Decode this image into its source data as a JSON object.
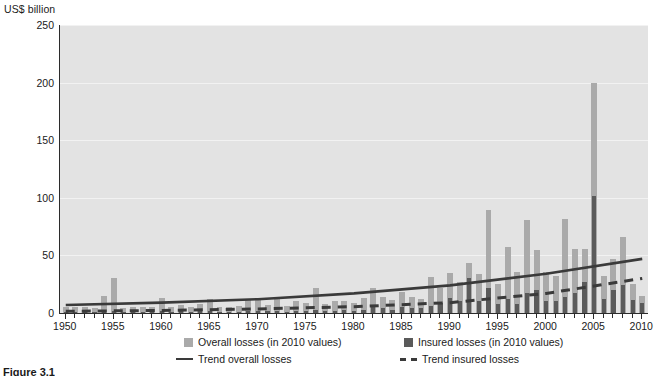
{
  "axis_title": "US$ billion",
  "caption": "Figure 3.1",
  "legend": {
    "overall_bar": "Overall losses (in 2010 values)",
    "insured_bar": "Insured losses (in 2010 values)",
    "trend_overall": "Trend overall losses",
    "trend_insured": "Trend insured losses"
  },
  "colors": {
    "overall": "#aaaaaa",
    "insured": "#5a5a5a",
    "trend_overall": "#3a3a3a",
    "trend_insured": "#3a3a3a",
    "plot_background": "#e3e3e3",
    "axis": "#2b2b2b"
  },
  "chart_data": {
    "type": "bar",
    "title": "",
    "xlabel": "",
    "ylabel": "US$ billion",
    "xlim": [
      1949.4,
      2010.6
    ],
    "ylim": [
      0,
      250
    ],
    "yticks": [
      0,
      50,
      100,
      150,
      200,
      250
    ],
    "xticks_major": [
      1950,
      1955,
      1960,
      1965,
      1970,
      1975,
      1980,
      1985,
      1990,
      1995,
      2000,
      2005,
      2010
    ],
    "xtick_labels": [
      "1950",
      "1955",
      "1960",
      "1965",
      "1970",
      "1975",
      "1980",
      "1985",
      "1990",
      "1995",
      "2000",
      "2005",
      "2010"
    ],
    "grid": true,
    "legend_position": "below",
    "x": [
      1950,
      1951,
      1952,
      1953,
      1954,
      1955,
      1956,
      1957,
      1958,
      1959,
      1960,
      1961,
      1962,
      1963,
      1964,
      1965,
      1966,
      1967,
      1968,
      1969,
      1970,
      1971,
      1972,
      1973,
      1974,
      1975,
      1976,
      1977,
      1978,
      1979,
      1980,
      1981,
      1982,
      1983,
      1984,
      1985,
      1986,
      1987,
      1988,
      1989,
      1990,
      1991,
      1992,
      1993,
      1994,
      1995,
      1996,
      1997,
      1998,
      1999,
      2000,
      2001,
      2002,
      2003,
      2004,
      2005,
      2006,
      2007,
      2008,
      2009,
      2010
    ],
    "series": [
      {
        "name": "Overall losses (in 2010 values)",
        "color": "#aaaaaa",
        "values": [
          5,
          5,
          5,
          4,
          15,
          30,
          4,
          5,
          5,
          5,
          13,
          5,
          7,
          5,
          8,
          12,
          5,
          5,
          6,
          11,
          12,
          7,
          14,
          6,
          10,
          9,
          22,
          8,
          10,
          10,
          9,
          13,
          22,
          14,
          11,
          18,
          14,
          12,
          31,
          22,
          35,
          27,
          43,
          34,
          89,
          25,
          57,
          36,
          81,
          55,
          36,
          32,
          82,
          56,
          56,
          200,
          32,
          47,
          66,
          25,
          15
        ]
      },
      {
        "name": "Insured losses (in 2010 values)",
        "color": "#5a5a5a",
        "values": [
          1,
          1,
          1,
          1,
          2,
          2,
          1,
          1,
          1,
          1,
          2,
          1,
          2,
          1,
          2,
          2,
          1,
          1,
          1,
          2,
          2,
          2,
          2,
          1,
          2,
          2,
          3,
          2,
          2,
          3,
          2,
          3,
          5,
          4,
          3,
          5,
          4,
          4,
          6,
          9,
          13,
          10,
          30,
          10,
          22,
          8,
          12,
          8,
          17,
          20,
          10,
          10,
          14,
          17,
          27,
          102,
          12,
          20,
          24,
          11,
          9
        ]
      }
    ],
    "trend_lines": [
      {
        "name": "Trend overall losses",
        "style": "solid",
        "color": "#3a3a3a",
        "points": [
          [
            1950,
            7
          ],
          [
            1960,
            9
          ],
          [
            1970,
            12
          ],
          [
            1980,
            17
          ],
          [
            1990,
            24
          ],
          [
            2000,
            34
          ],
          [
            2010,
            47
          ]
        ]
      },
      {
        "name": "Trend insured losses",
        "style": "dashed",
        "color": "#3a3a3a",
        "points": [
          [
            1950,
            1.5
          ],
          [
            1960,
            2.2
          ],
          [
            1970,
            3.5
          ],
          [
            1980,
            5.5
          ],
          [
            1990,
            9
          ],
          [
            2000,
            17
          ],
          [
            2010,
            30
          ]
        ]
      }
    ]
  }
}
